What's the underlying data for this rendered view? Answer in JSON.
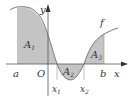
{
  "diagram": {
    "type": "area-under-curve",
    "function_label": "f",
    "axes": {
      "x_label": "x",
      "y_label": "y",
      "origin_label": "O"
    },
    "points": {
      "a": "a",
      "b": "b",
      "x1": "x",
      "x1_sub": "1",
      "x2": "x",
      "x2_sub": "2"
    },
    "regions": [
      {
        "label": "A",
        "sub": "1",
        "sign": "positive"
      },
      {
        "label": "A",
        "sub": "2",
        "sign": "negative"
      },
      {
        "label": "A",
        "sub": "3",
        "sign": "positive"
      }
    ],
    "colors": {
      "fill": "#c4c4c4",
      "curve": "#777777",
      "axis": "#555555",
      "background": "#ffffff"
    }
  }
}
